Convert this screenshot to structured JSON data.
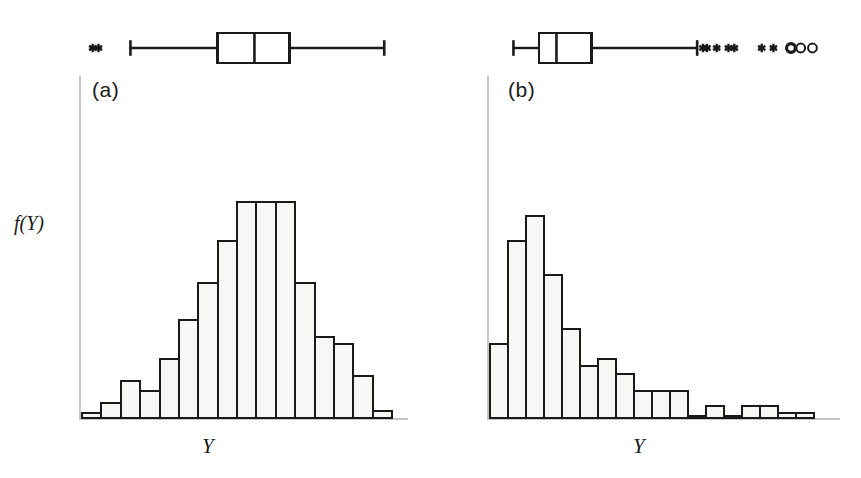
{
  "figure": {
    "background_color": "#ffffff",
    "ink_color": "#1a1a1a",
    "bar_fill_color": "#f7f7f5",
    "axis_color": "#c8c8c8"
  },
  "panels": [
    {
      "id": "a",
      "caption": "(a)",
      "xlabel": "Y",
      "ylabel": "f(Y)",
      "shape_description": "symmetric bell-shaped"
    },
    {
      "id": "b",
      "caption": "(b)",
      "xlabel": "Y",
      "ylabel": "",
      "shape_description": "right-skewed"
    }
  ],
  "chart_data": [
    {
      "type": "bar",
      "panel": "a",
      "title": "(a)",
      "xlabel": "Y",
      "ylabel": "f(Y)",
      "grid": false,
      "legend": "none",
      "categories": [
        "1",
        "2",
        "3",
        "4",
        "5",
        "6",
        "7",
        "8",
        "9",
        "10",
        "11",
        "12",
        "13",
        "14",
        "15",
        "16"
      ],
      "values": [
        2,
        6,
        15,
        11,
        24,
        40,
        55,
        72,
        88,
        88,
        88,
        55,
        33,
        30,
        17,
        3
      ],
      "ylim": [
        0,
        100
      ],
      "boxplot": {
        "orientation": "horizontal",
        "whisker_low": 2.5,
        "q1": 7.0,
        "median": 8.9,
        "q3": 10.7,
        "whisker_high": 15.6,
        "outliers_low": [
          0.55,
          0.85
        ],
        "outliers_high": [],
        "outlier_marker_low": "asterisk",
        "outlier_marker_high": "none"
      }
    },
    {
      "type": "bar",
      "panel": "b",
      "title": "(b)",
      "xlabel": "Y",
      "ylabel": "",
      "grid": false,
      "legend": "none",
      "categories": [
        "1",
        "2",
        "3",
        "4",
        "5",
        "6",
        "7",
        "8",
        "9",
        "10",
        "11",
        "12",
        "13",
        "14",
        "15",
        "16",
        "17",
        "18",
        "19"
      ],
      "values": [
        30,
        72,
        82,
        58,
        36,
        21,
        24,
        18,
        11,
        11,
        11,
        1,
        5,
        1,
        5,
        5,
        2,
        2,
        0
      ],
      "ylim": [
        0,
        100
      ],
      "boxplot": {
        "orientation": "horizontal",
        "whisker_low": 1.2,
        "q1": 2.5,
        "median": 3.4,
        "q3": 5.2,
        "whisker_high": 10.6,
        "outliers_low": [],
        "outliers_high": [
          10.9,
          11.1,
          11.6,
          12.2,
          12.5,
          13.9,
          14.5,
          15.4,
          15.9,
          16.5
        ],
        "outlier_marker_low": "none",
        "outlier_marker_high": "asterisk-then-circle",
        "near_outlier_count": 7,
        "far_outlier_count": 3
      }
    }
  ]
}
